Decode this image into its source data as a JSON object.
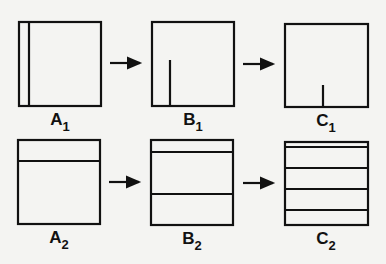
{
  "diagram": {
    "rows": [
      {
        "id": "row-1",
        "panels": [
          {
            "label": "A",
            "subscript": "1",
            "box": [
              19,
              22,
              82,
              84
            ],
            "vertical_lines": [
              {
                "x": 29,
                "y1": 22,
                "y2": 106
              }
            ]
          },
          {
            "label": "B",
            "subscript": "1",
            "box": [
              152,
              22,
              82,
              84
            ],
            "vertical_lines": [
              {
                "x": 170,
                "y1": 60,
                "y2": 106
              }
            ]
          },
          {
            "label": "C",
            "subscript": "1",
            "box": [
              285,
              24,
              83,
              83
            ],
            "vertical_lines": [
              {
                "x": 323,
                "y1": 85,
                "y2": 107
              }
            ]
          }
        ]
      },
      {
        "id": "row-2",
        "panels": [
          {
            "label": "A",
            "subscript": "2",
            "box": [
              18,
              140,
              82,
              84
            ],
            "horizontal_lines": [
              161
            ]
          },
          {
            "label": "B",
            "subscript": "2",
            "box": [
              151,
              140,
              82,
              85
            ],
            "horizontal_lines": [
              152,
              194
            ]
          },
          {
            "label": "C",
            "subscript": "2",
            "box": [
              285,
              142,
              83,
              83
            ],
            "horizontal_lines": [
              147,
              168,
              189,
              210
            ]
          }
        ]
      }
    ],
    "arrows": [
      {
        "from": "A1",
        "to": "B1"
      },
      {
        "from": "B1",
        "to": "C1"
      },
      {
        "from": "A2",
        "to": "B2"
      },
      {
        "from": "B2",
        "to": "C2"
      }
    ],
    "labels": {
      "a1": "A",
      "a1_sub": "1",
      "b1": "B",
      "b1_sub": "1",
      "c1": "C",
      "c1_sub": "1",
      "a2": "A",
      "a2_sub": "2",
      "b2": "B",
      "b2_sub": "2",
      "c2": "C",
      "c2_sub": "2"
    },
    "colors": {
      "ink": "#111111",
      "background": "#f4f4f2"
    }
  }
}
